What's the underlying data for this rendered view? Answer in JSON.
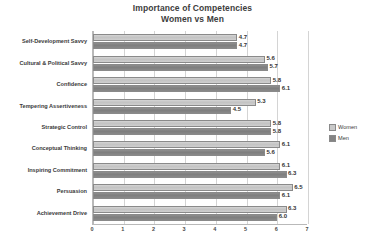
{
  "chart_data": {
    "type": "bar",
    "orientation": "horizontal",
    "title": "Importance of Competencies",
    "subtitle": "Women vs Men",
    "title_lines": [
      "Importance of Competencies",
      "Women vs Men"
    ],
    "xlabel": "",
    "ylabel": "",
    "xlim": [
      0,
      7
    ],
    "xticks": [
      "0",
      "1",
      "2",
      "3",
      "4",
      "5",
      "6",
      "7"
    ],
    "grid": "vertical",
    "legend_position": "right",
    "categories": [
      "Self-Development Savvy",
      "Cultural & Political Savvy",
      "Confidence",
      "Tempering Assertiveness",
      "Strategic Control",
      "Conceptual Thinking",
      "Inspiring Commitment",
      "Persuasion",
      "Achievement Drive"
    ],
    "series": [
      {
        "name": "Women",
        "color": "#c9c9c9",
        "values": [
          4.7,
          5.6,
          5.8,
          5.3,
          5.8,
          6.1,
          6.1,
          6.5,
          6.3
        ],
        "labels": [
          "4.7",
          "5.6",
          "5.8",
          "5.3",
          "5.8",
          "6.1",
          "6.1",
          "6.5",
          "6.3"
        ]
      },
      {
        "name": "Men",
        "color": "#848484",
        "values": [
          4.7,
          5.7,
          6.1,
          4.5,
          5.8,
          5.6,
          6.3,
          6.1,
          6.0
        ],
        "labels": [
          "4.7",
          "5.7",
          "6.1",
          "4.5",
          "5.8",
          "5.6",
          "6.3",
          "6.1",
          "6.0"
        ]
      }
    ]
  },
  "legend": {
    "items": [
      {
        "label": "Women"
      },
      {
        "label": "Men"
      }
    ]
  }
}
